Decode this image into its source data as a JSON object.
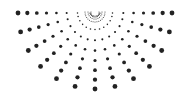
{
  "graphic": {
    "type": "half-sunburst-dot-pattern",
    "color": "#222222",
    "background": "#ffffff",
    "center": [
      95,
      12
    ],
    "rays": 13,
    "start_angle_deg": 0,
    "end_angle_deg": 180,
    "dots_per_ray": 8,
    "inner_radius": 5,
    "outer_radius": 77,
    "min_dot_radius": 0.5,
    "max_dot_radius": 2.4,
    "inner_arcs": [
      4,
      7,
      10
    ]
  }
}
